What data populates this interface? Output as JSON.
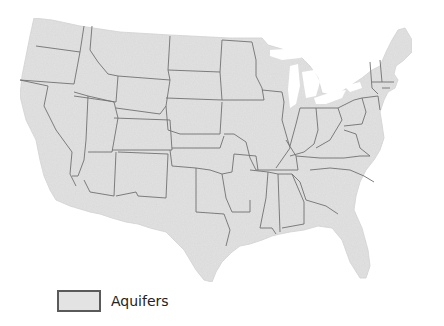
{
  "map": {
    "title": "",
    "region": "Contiguous United States",
    "land_color": "#e3e3e3",
    "border_color": "#6e6e6e",
    "background_color": "#ffffff"
  },
  "legend": {
    "items": [
      {
        "label": "Aquifers",
        "swatch_color": "#e3e3e3",
        "swatch_border": "#5a5a5a"
      }
    ]
  }
}
